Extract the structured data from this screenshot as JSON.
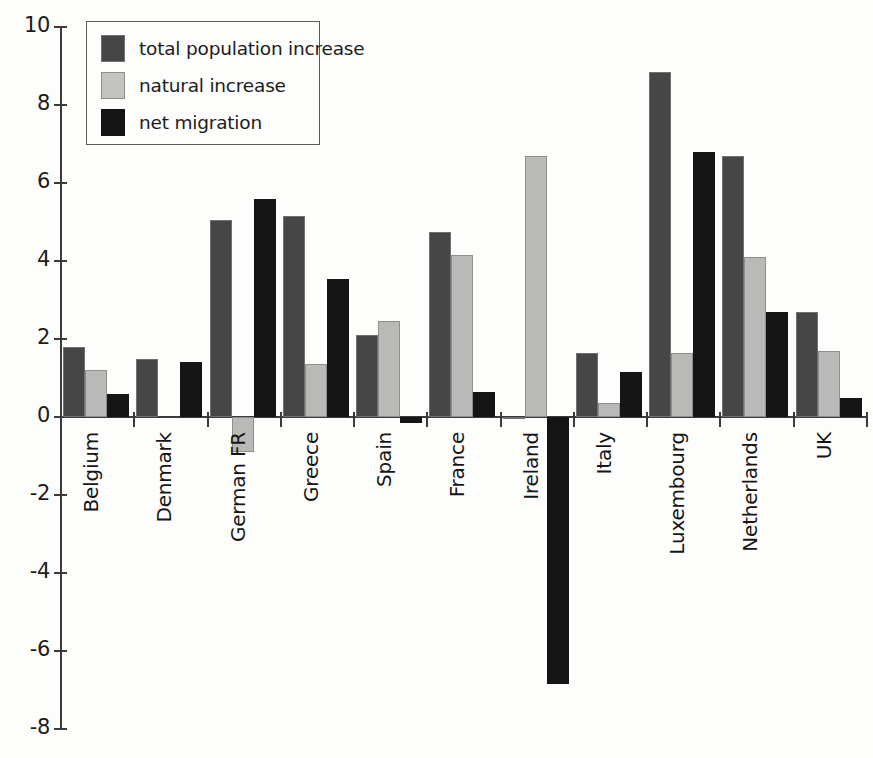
{
  "chart_data": {
    "type": "bar",
    "title": "",
    "xlabel": "",
    "ylabel": "",
    "ylim": [
      -8,
      10
    ],
    "ytick_values": [
      10,
      8,
      6,
      4,
      2,
      0,
      -2,
      -4,
      -6,
      -8
    ],
    "ytick_labels": [
      "10",
      "8",
      "6",
      "4",
      "2",
      "0",
      "-2",
      "-4",
      "-6",
      "-8"
    ],
    "grid": false,
    "legend_position": "top-left",
    "categories": [
      "Belgium",
      "Denmark",
      "German FR",
      "Greece",
      "Spain",
      "France",
      "Ireland",
      "Italy",
      "Luxembourg",
      "Netherlands",
      "UK"
    ],
    "series": [
      {
        "name": "total population increase",
        "color": "#464646",
        "values": [
          1.8,
          1.5,
          5.05,
          5.15,
          2.1,
          4.75,
          -0.05,
          1.65,
          8.85,
          6.7,
          2.7
        ]
      },
      {
        "name": "natural increase",
        "color": "#b9b9b7",
        "values": [
          1.2,
          0.0,
          -0.9,
          1.35,
          2.45,
          4.15,
          6.7,
          0.35,
          1.65,
          4.1,
          1.7
        ]
      },
      {
        "name": "net migration",
        "color": "#151515",
        "values": [
          0.6,
          1.4,
          5.6,
          3.55,
          -0.15,
          0.65,
          -6.85,
          1.15,
          6.8,
          2.7,
          0.5
        ]
      }
    ]
  },
  "legend": {
    "items": [
      {
        "label": "total population increase",
        "key": "total"
      },
      {
        "label": "natural increase",
        "key": "natural"
      },
      {
        "label": "net migration",
        "key": "migration"
      }
    ]
  }
}
